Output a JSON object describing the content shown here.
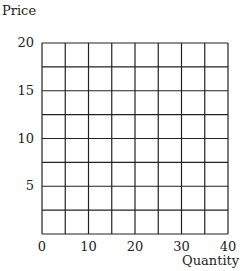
{
  "chart_data": {
    "type": "line",
    "title": "",
    "xlabel": "Quantity",
    "ylabel": "Price",
    "xlim": [
      0,
      40
    ],
    "ylim": [
      0,
      20
    ],
    "x_ticks": [
      0,
      10,
      20,
      30,
      40
    ],
    "y_ticks": [
      5,
      10,
      15,
      20
    ],
    "x_tick_labels": [
      "0",
      "10",
      "20",
      "30",
      "40"
    ],
    "y_tick_labels": [
      "5",
      "10",
      "15",
      "20"
    ],
    "grid": true,
    "grid_x_step": 5,
    "grid_y_step": 2.5,
    "series": [],
    "legend": null
  },
  "colors": {
    "grid": "#222222",
    "background": "#ffffff",
    "text": "#222222"
  }
}
